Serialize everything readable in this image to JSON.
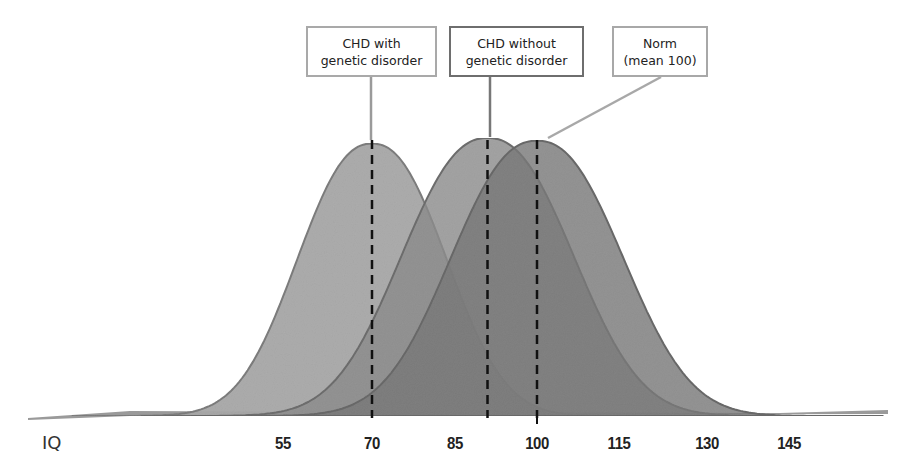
{
  "chart_data": {
    "type": "area",
    "title": "",
    "xlabel": "IQ",
    "ylabel": "",
    "x_ticks": [
      55,
      70,
      85,
      100,
      115,
      130,
      145
    ],
    "xlim": [
      25,
      162
    ],
    "grid": false,
    "legend_position": "callout boxes above peaks",
    "series": [
      {
        "name": "CHD with genetic disorder",
        "distribution": "normal",
        "mean": 70,
        "sd": 13,
        "fill": "#a9a9a9",
        "stroke": "#7e7e7e"
      },
      {
        "name": "CHD without genetic disorder",
        "distribution": "normal",
        "mean": 91,
        "sd": 15,
        "fill": "#8c8c8c",
        "stroke": "#6e6e6e"
      },
      {
        "name": "Norm (mean 100)",
        "distribution": "normal",
        "mean": 100,
        "sd": 15,
        "fill": "#787878",
        "stroke": "#6a6a6a"
      }
    ],
    "annotations": [
      {
        "type": "dashed-vline",
        "x": 70,
        "series": "CHD with genetic disorder"
      },
      {
        "type": "dashed-vline",
        "x": 91,
        "series": "CHD without genetic disorder"
      },
      {
        "type": "dashed-vline",
        "x": 100,
        "series": "Norm (mean 100)"
      }
    ]
  },
  "labels": {
    "box1": {
      "line1": "CHD with",
      "line2": "genetic disorder"
    },
    "box2": {
      "line1": "CHD without",
      "line2": "genetic disorder"
    },
    "box3": {
      "line1": "Norm",
      "line2": "(mean 100)"
    }
  },
  "axis": {
    "name": "IQ",
    "ticks": [
      "55",
      "70",
      "85",
      "100",
      "115",
      "130",
      "145"
    ]
  }
}
